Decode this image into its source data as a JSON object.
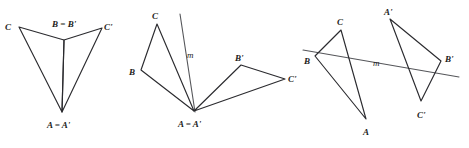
{
  "page": {
    "background_color": "#ffffff",
    "width": 469,
    "height": 148
  },
  "style": {
    "edge_color": "#2b2b2f",
    "mirror_color": "#55565a",
    "label_color": "#1c1c20",
    "faint_color": "#f2f2f3"
  },
  "figures": [
    {
      "id": "figure-1",
      "name": "reflection-over-vertical-line-through-A-and-B",
      "labels": {
        "c": "C",
        "b": "B = B'",
        "c_prime": "C'",
        "a": "A = A'"
      },
      "points": {
        "C": [
          19,
          27
        ],
        "B": [
          64,
          40
        ],
        "Cp": [
          102,
          28
        ],
        "A": [
          62,
          112
        ]
      },
      "paths": {
        "triangle_left": "M19,27 L64,40 L62,112 Z",
        "triangle_right": "M102,28 L64,40 L62,112 Z"
      },
      "label_positions": {
        "c": [
          5,
          27
        ],
        "b": [
          52,
          24
        ],
        "c_prime": [
          104,
          27
        ],
        "a": [
          47,
          126
        ]
      }
    },
    {
      "id": "figure-2",
      "name": "reflection-over-line-m-through-shared-vertex-A",
      "labels": {
        "c": "C",
        "b": "B",
        "m": "m",
        "b_prime": "B'",
        "c_prime": "C'",
        "a": "A = A'"
      },
      "points": {
        "C": [
          157,
          24
        ],
        "B": [
          141,
          70
        ],
        "A": [
          194,
          111
        ],
        "Bp": [
          241,
          65
        ],
        "Cp": [
          285,
          79
        ],
        "m_top": [
          180,
          14
        ],
        "m_bottom": [
          195,
          112
        ]
      },
      "paths": {
        "triangle_pre": "M157,24 L141,70 L194,111 Z",
        "triangle_image": "M241,65 L285,79 L194,111 Z",
        "mirror": "M180,14 L195,112"
      },
      "label_positions": {
        "c": [
          152,
          16
        ],
        "b": [
          129,
          72
        ],
        "m": [
          187,
          55
        ],
        "b_prime": [
          235,
          58
        ],
        "c_prime": [
          288,
          79
        ],
        "a": [
          178,
          125
        ]
      }
    },
    {
      "id": "figure-3",
      "name": "reflection-over-slanted-line-m-separating-triangles",
      "labels": {
        "c": "C",
        "b": "B",
        "m": "m",
        "a": "A",
        "a_prime": "A'",
        "b_prime": "B'",
        "c_prime": "C'"
      },
      "points": {
        "C": [
          341,
          30
        ],
        "B": [
          315,
          56
        ],
        "A": [
          366,
          119
        ],
        "Ap": [
          390,
          19
        ],
        "Bp": [
          441,
          61
        ],
        "Cp": [
          421,
          101
        ],
        "m_left": [
          303,
          50
        ],
        "m_right": [
          459,
          77
        ]
      },
      "paths": {
        "triangle_pre": "M341,30 L315,56 L366,119 Z",
        "triangle_image": "M390,19 L441,61 L421,101 Z",
        "mirror": "M303,50 L459,77"
      },
      "label_positions": {
        "c": [
          337,
          22
        ],
        "b": [
          304,
          61
        ],
        "m": [
          373,
          63
        ],
        "a": [
          363,
          133
        ],
        "a_prime": [
          384,
          12
        ],
        "b_prime": [
          445,
          59
        ],
        "c_prime": [
          417,
          115
        ]
      }
    }
  ],
  "faint_marks": [
    {
      "text": "",
      "x": 28,
      "y": 138
    },
    {
      "text": "",
      "x": 180,
      "y": 138
    },
    {
      "text": "",
      "x": 330,
      "y": 138
    }
  ]
}
